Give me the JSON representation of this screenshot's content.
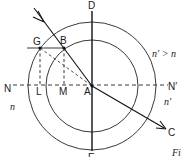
{
  "diagram": {
    "points": {
      "D": "D",
      "E": "E",
      "N": "N",
      "N_prime": "N′",
      "A": "A",
      "B": "B",
      "G": "G",
      "L": "L",
      "M": "M",
      "C": "C"
    },
    "media": {
      "upper_right": "n′ > n",
      "lower_left": "n",
      "lower_right": "n′"
    },
    "caption_fragment": "Fi"
  }
}
